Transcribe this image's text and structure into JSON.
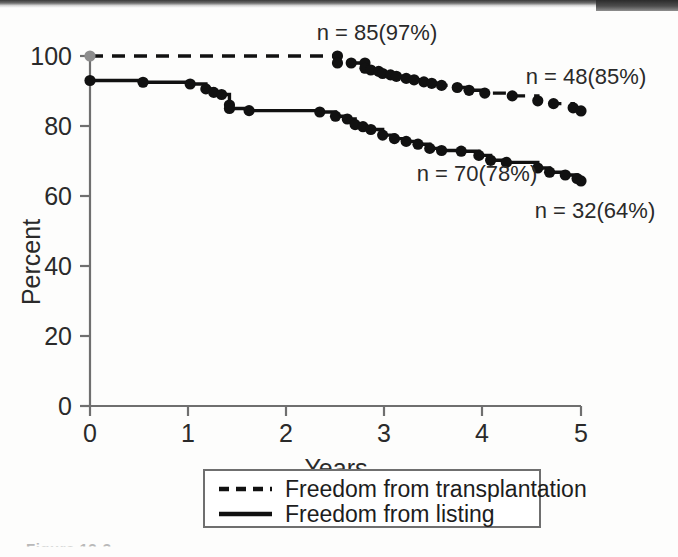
{
  "figure": {
    "caption_partial": "Figure 12-3"
  },
  "chart_data": {
    "type": "line",
    "title": "",
    "xlabel": "Years",
    "ylabel": "Percent",
    "xlim": [
      0,
      5
    ],
    "ylim": [
      0,
      100
    ],
    "xticks": [
      0,
      1,
      2,
      3,
      4,
      5
    ],
    "yticks": [
      0,
      20,
      40,
      60,
      80,
      100
    ],
    "xtick_labels": [
      "0",
      "1",
      "2",
      "3",
      "4",
      "5"
    ],
    "ytick_labels": [
      "0",
      "20",
      "40",
      "60",
      "80",
      "100"
    ],
    "grid": false,
    "legend_position": "below-axes",
    "series": [
      {
        "name": "Freedom from transplantation",
        "style": "dashed",
        "color": "#111111",
        "x": [
          0.0,
          2.52,
          2.52,
          2.66,
          2.8,
          2.8,
          2.86,
          2.94,
          2.98,
          3.06,
          3.12,
          3.22,
          3.3,
          3.4,
          3.48,
          3.58,
          3.74,
          3.86,
          4.02,
          4.3,
          4.56,
          4.72,
          4.92,
          5.0
        ],
        "y": [
          100.0,
          100.0,
          98.0,
          98.0,
          98.0,
          96.5,
          96.0,
          95.6,
          95.0,
          94.6,
          94.2,
          93.6,
          93.2,
          92.6,
          92.2,
          91.6,
          91.0,
          90.2,
          89.4,
          88.6,
          87.2,
          86.4,
          85.2,
          84.3
        ]
      },
      {
        "name": "Freedom from listing",
        "style": "solid",
        "color": "#111111",
        "x": [
          0.0,
          0.54,
          1.02,
          1.18,
          1.26,
          1.34,
          1.42,
          1.42,
          1.62,
          2.34,
          2.5,
          2.62,
          2.7,
          2.78,
          2.86,
          2.98,
          3.1,
          3.22,
          3.34,
          3.46,
          3.58,
          3.78,
          3.96,
          4.08,
          4.24,
          4.56,
          4.68,
          4.84,
          4.96,
          5.0
        ],
        "y": [
          93.0,
          92.5,
          92.0,
          90.6,
          89.6,
          89.0,
          86.0,
          85.0,
          84.4,
          84.0,
          82.8,
          82.0,
          80.4,
          79.8,
          79.0,
          77.4,
          76.4,
          75.6,
          74.8,
          73.6,
          73.0,
          72.8,
          71.6,
          70.2,
          69.6,
          68.0,
          66.8,
          66.0,
          65.0,
          64.3
        ]
      }
    ],
    "annotations": [
      {
        "text": "n = 85(97%)",
        "x": 2.55,
        "y": 100.0,
        "series": "Freedom from transplantation"
      },
      {
        "text": "n = 48(85%)",
        "x": 4.55,
        "y": 90.5,
        "series": "Freedom from transplantation"
      },
      {
        "text": "n = 70(78%)",
        "x": 3.25,
        "y": 70.0,
        "series": "Freedom from listing"
      },
      {
        "text": "n = 32(64%)",
        "x": 4.4,
        "y": 61.0,
        "series": "Freedom from listing"
      }
    ],
    "legend": [
      {
        "label": "Freedom from transplantation",
        "style": "dashed"
      },
      {
        "label": "Freedom from listing",
        "style": "solid"
      }
    ],
    "start_marker_color": "#8d8d8d"
  }
}
